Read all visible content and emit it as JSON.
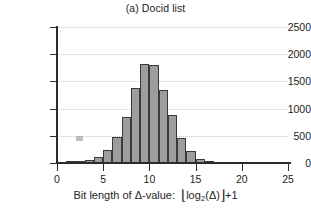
{
  "chart_data": {
    "type": "bar",
    "title": "(a) Docid list",
    "xlabel": "Bit length of Δ-value:  ⌊log₂(Δ)⌋ +1",
    "xlabel_parts": {
      "prefix": "Bit length of Δ-value:",
      "floor_open": "⌊",
      "log_base": "log",
      "subscript": "2",
      "arg": "(Δ)",
      "floor_close": "⌋",
      "suffix": "+1"
    },
    "ylabel": "",
    "categories": [
      1,
      2,
      3,
      4,
      5,
      6,
      7,
      8,
      9,
      10,
      11,
      12,
      13,
      14,
      15,
      16,
      17
    ],
    "values": [
      0,
      10,
      40,
      55,
      110,
      240,
      470,
      845,
      1375,
      1820,
      1800,
      1340,
      890,
      460,
      225,
      75,
      10
    ],
    "xlim": [
      0,
      25
    ],
    "ylim": [
      0,
      2500
    ],
    "xticks": [
      0,
      5,
      10,
      15,
      20,
      25
    ],
    "yticks": [
      0,
      500,
      1000,
      1500,
      2000,
      2500
    ],
    "xtick_labels": [
      "0",
      "5",
      "10",
      "15",
      "20",
      "25"
    ],
    "ytick_labels": [
      "0",
      "500",
      "1000",
      "1500",
      "2000",
      "2500"
    ],
    "grid": "horizontal-dotted",
    "legend": null,
    "bar_fill_color": "#9d9d9d",
    "bar_edge_color": "#3a3a3a",
    "grid_color": "#c9c9c9",
    "axis_color": "#2b2b2b"
  }
}
